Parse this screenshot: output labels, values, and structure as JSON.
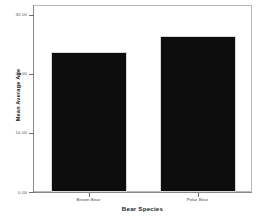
{
  "chart_data": {
    "type": "bar",
    "title": "",
    "subtitle": "",
    "categories": [
      "Brown Bear",
      "Polar Bear"
    ],
    "values": [
      23.7,
      26.5
    ],
    "xlabel": "Bear Species",
    "ylabel": "Mean Average Age",
    "ylim": [
      0,
      31.5
    ],
    "yticks": [
      0,
      10,
      20,
      30
    ],
    "ytick_labels": [
      "0.00",
      "10.00",
      "20.00",
      "30.00"
    ],
    "grid": false,
    "legend": false,
    "legend_position": "none",
    "bar_color": "#0d0d0d",
    "frame_color": "#b9b9b9",
    "axis_color": "#8a8a8a",
    "background": "#ffffff"
  }
}
